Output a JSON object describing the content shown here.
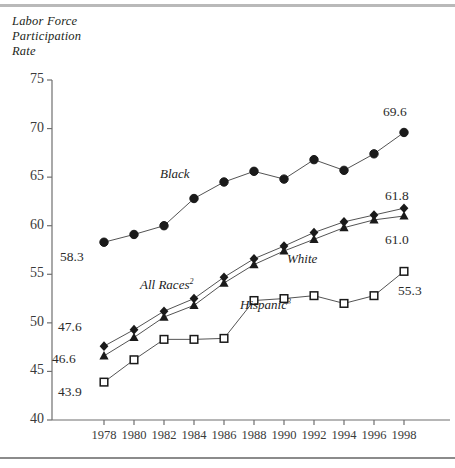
{
  "figure": {
    "axis_title": "Labor Force\nParticipation\nRate",
    "top_rule_color": "#b9b9b9",
    "bottom_rule_color": "#8b8b8b"
  },
  "chart_data": {
    "type": "line",
    "title": "Labor Force Participation Rate",
    "xlabel": "",
    "ylabel": "Labor Force Participation Rate",
    "x": [
      1978,
      1980,
      1982,
      1984,
      1986,
      1988,
      1990,
      1992,
      1994,
      1996,
      1998
    ],
    "xtick_labels": [
      "1978",
      "1980",
      "1982",
      "1984",
      "1986",
      "1988",
      "1990",
      "1992",
      "1994",
      "1996",
      "1998"
    ],
    "ytick_labels": [
      "75",
      "70",
      "65",
      "60",
      "55",
      "50",
      "45",
      "40"
    ],
    "yticks": [
      75,
      70,
      65,
      60,
      55,
      50,
      45,
      40
    ],
    "ylim": [
      40,
      75
    ],
    "xlim": [
      1977,
      1999
    ],
    "grid": false,
    "legend": "inline-series-labels",
    "series": [
      {
        "name": "Black",
        "label": "Black",
        "marker": "circle-filled",
        "color": "#1a1a1a",
        "values": [
          58.3,
          59.1,
          60.0,
          62.8,
          64.5,
          65.6,
          64.8,
          66.8,
          65.7,
          67.4,
          69.6
        ],
        "start_label": "58.3",
        "end_label": "69.6"
      },
      {
        "name": "All Races",
        "label": "All Races",
        "label_superscript": "2",
        "marker": "diamond-filled",
        "color": "#1a1a1a",
        "values": [
          47.6,
          49.3,
          51.2,
          52.5,
          54.7,
          56.6,
          57.9,
          59.3,
          60.4,
          61.1,
          61.8
        ],
        "start_label": "47.6",
        "end_label": "61.8"
      },
      {
        "name": "White",
        "label": "White",
        "marker": "triangle-filled",
        "color": "#1a1a1a",
        "values": [
          46.6,
          48.5,
          50.6,
          51.8,
          54.1,
          56.0,
          57.4,
          58.6,
          59.8,
          60.6,
          61.0
        ],
        "start_label": "46.6",
        "end_label": "61.0"
      },
      {
        "name": "Hispanic",
        "label": "Hispanic",
        "label_superscript": "3",
        "marker": "square-open",
        "color": "#1a1a1a",
        "values": [
          43.9,
          46.2,
          48.3,
          48.3,
          48.4,
          52.3,
          52.5,
          52.8,
          52.0,
          52.8,
          55.3
        ],
        "start_label": "43.9",
        "end_label": "55.3"
      }
    ],
    "annotations": [
      {
        "text": "58.3",
        "series": "Black",
        "position": "below-left-endpoint"
      },
      {
        "text": "69.6",
        "series": "Black",
        "position": "above-right-endpoint"
      },
      {
        "text": "47.6",
        "series": "All Races",
        "position": "above-left-endpoint"
      },
      {
        "text": "61.8",
        "series": "All Races",
        "position": "above-right-endpoint"
      },
      {
        "text": "46.6",
        "series": "White",
        "position": "below-left-endpoint"
      },
      {
        "text": "61.0",
        "series": "White",
        "position": "below-right-endpoint"
      },
      {
        "text": "43.9",
        "series": "Hispanic",
        "position": "below-left-endpoint"
      },
      {
        "text": "55.3",
        "series": "Hispanic",
        "position": "below-right-endpoint"
      }
    ]
  }
}
